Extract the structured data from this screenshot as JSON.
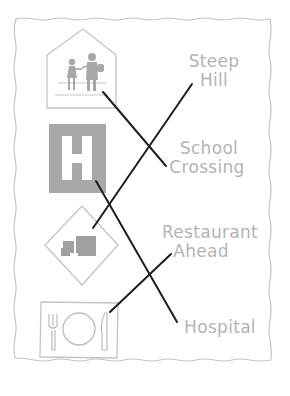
{
  "worksheet": {
    "signs": [
      {
        "id": "school-crossing-sign",
        "description": "children crossing pentagon sign"
      },
      {
        "id": "hospital-sign",
        "description": "square sign with letter H",
        "glyph": "H"
      },
      {
        "id": "steep-hill-sign",
        "description": "diamond sign with truck on slope"
      },
      {
        "id": "restaurant-sign",
        "description": "rectangle sign with fork, plate, knife"
      }
    ],
    "labels": [
      {
        "lines": [
          "Steep",
          "Hill"
        ]
      },
      {
        "lines": [
          "School",
          "Crossing"
        ]
      },
      {
        "lines": [
          "Restaurant",
          "Ahead"
        ]
      },
      {
        "lines": [
          "Hospital"
        ]
      }
    ],
    "matches": [
      {
        "from": "school-crossing-sign",
        "to": "School Crossing"
      },
      {
        "from": "steep-hill-sign",
        "to": "Steep Hill"
      },
      {
        "from": "hospital-sign",
        "to": "Hospital"
      },
      {
        "from": "restaurant-sign",
        "to": "Restaurant Ahead"
      }
    ],
    "colors": {
      "border": "#c4c4c4",
      "sign_gray": "#a8a8a8",
      "label": "#b4b4b4",
      "line": "#1e1e1e"
    }
  }
}
